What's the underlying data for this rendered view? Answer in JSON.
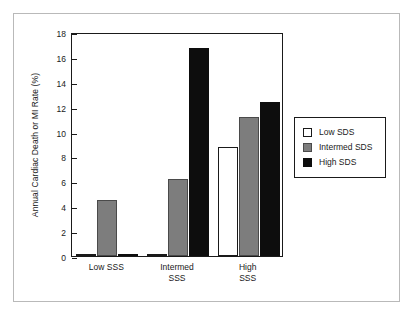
{
  "chart_data": {
    "type": "bar",
    "title": "",
    "subtitle": "",
    "xlabel": "",
    "ylabel": "Annual Cardiac Death or MI Rate (%)",
    "categories": [
      "Low SSS",
      "Intermed\nSSS",
      "High SSS"
    ],
    "series": [
      {
        "name": "Low SDS",
        "values": [
          0.0,
          0.0,
          8.8
        ],
        "color": "#ffffff"
      },
      {
        "name": "Intermed SDS",
        "values": [
          4.5,
          6.2,
          11.2
        ],
        "color": "#7d7d7d"
      },
      {
        "name": "High SDS",
        "values": [
          0.0,
          16.7,
          12.4
        ],
        "color": "#0d0d0d"
      }
    ],
    "baseline_stubs": [
      0.15,
      0.15,
      0.0
    ],
    "ylim": [
      0,
      18
    ],
    "yticks": [
      0,
      2,
      4,
      6,
      8,
      10,
      12,
      14,
      16,
      18
    ],
    "ytick_labels": [
      "0",
      "2",
      "4",
      "6",
      "8",
      "10",
      "12",
      "14",
      "16",
      "18"
    ],
    "grid": false,
    "legend_position": "right",
    "legend_entries": [
      "Low SDS",
      "Intermed SDS",
      "High SDS"
    ]
  },
  "figure": {
    "frame_color": "#b9b9b9",
    "axis_color": "#1a1a1a",
    "background": "#ffffff"
  }
}
